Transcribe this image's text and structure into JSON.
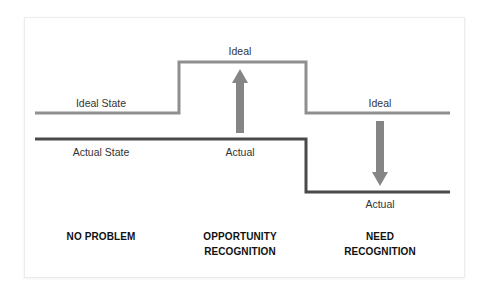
{
  "diagram": {
    "colors": {
      "ideal_line": "#8f8f8f",
      "actual_line": "#4a4a4a",
      "arrow": "#858585",
      "text": "#333333",
      "card_border": "#ececec"
    },
    "lines": {
      "ideal_state_label": "Ideal State",
      "actual_state_label": "Actual State"
    },
    "columns": [
      {
        "category": [
          "NO PROBLEM"
        ],
        "ideal_label": "",
        "actual_label": "",
        "arrow": "none"
      },
      {
        "category": [
          "OPPORTUNITY",
          "RECOGNITION"
        ],
        "ideal_label": "Ideal",
        "actual_label": "Actual",
        "arrow": "up"
      },
      {
        "category": [
          "NEED",
          "RECOGNITION"
        ],
        "ideal_label": "Ideal",
        "actual_label": "Actual",
        "arrow": "down"
      }
    ]
  }
}
